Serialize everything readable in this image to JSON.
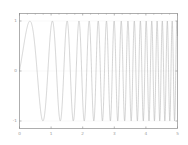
{
  "figure": {
    "background_color": "#ffffff",
    "axes_color": "#8c8c8c",
    "line_color": "#a8a8a8",
    "grid_color": "#d8d8d8",
    "tick_label_color": "#9a9a9a"
  },
  "chart_data": {
    "type": "line",
    "title": "",
    "subtitle": "",
    "xlabel": "",
    "ylabel": "",
    "xlim": [
      0,
      5
    ],
    "ylim": [
      -1.15,
      1.15
    ],
    "grid": false,
    "legend": null,
    "legend_position": "none",
    "xticks": [
      0,
      1,
      2,
      3,
      4,
      5
    ],
    "xtick_labels": [
      "0",
      "1",
      "2",
      "3",
      "4",
      "5"
    ],
    "yticks": [
      1,
      0,
      -1
    ],
    "ytick_labels": [
      "1",
      "0",
      "-1"
    ],
    "minor_xticks": [
      0.25,
      0.5,
      0.75,
      1.25,
      1.5,
      1.75,
      2.25,
      2.5,
      2.75,
      3.25,
      3.5,
      3.75,
      4.25,
      4.5,
      4.75
    ],
    "series": [
      {
        "name": "chirp",
        "description": "Linear frequency chirp: y = sin(2*pi*(f0*t + 0.5*k*t*t)) with f0 = 0.55 Hz and k = 1.25 Hz/s, sampled densely from t = 0 to t = 5",
        "formula_f0": 0.55,
        "formula_k": 1.25,
        "amplitude": 1,
        "t_start": 0,
        "t_end": 5,
        "sample_count": 4000,
        "x": [
          0,
          0.25,
          0.5,
          0.75,
          1,
          1.25,
          1.5,
          1.75,
          2,
          2.25,
          2.5,
          2.75,
          3,
          3.25,
          3.5,
          3.75,
          4,
          4.25,
          4.5,
          4.75,
          5
        ],
        "instantaneous_frequency": [
          0.55,
          0.86,
          1.18,
          1.49,
          1.8,
          2.11,
          2.43,
          2.74,
          3.05,
          3.36,
          3.68,
          3.99,
          4.3,
          4.61,
          4.93,
          5.24,
          5.55,
          5.86,
          6.18,
          6.49,
          6.8
        ]
      }
    ]
  }
}
